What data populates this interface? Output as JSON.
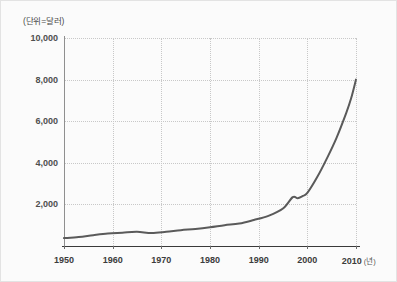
{
  "chart_data": {
    "type": "line",
    "title": "",
    "subtitle": "",
    "unit_label": "(단위=달러)",
    "xlabel": "(년)",
    "ylabel": "",
    "xlim": [
      1950,
      2010
    ],
    "ylim": [
      0,
      10000
    ],
    "grid": true,
    "legend": null,
    "y_ticks": [
      "10,000",
      "8,000",
      "6,000",
      "4,000",
      "2,000"
    ],
    "y_tick_values": [
      10000,
      8000,
      6000,
      4000,
      2000
    ],
    "x_ticks": [
      "1950",
      "1960",
      "1970",
      "1980",
      "1990",
      "2000",
      "2010"
    ],
    "x_tick_values": [
      1950,
      1960,
      1970,
      1980,
      1990,
      2000,
      2010
    ],
    "x_last_label_suffix": "(년)",
    "series": [
      {
        "name": "1인당 국민소득",
        "color": "#5a5a5a",
        "x": [
          1950,
          1953,
          1956,
          1959,
          1962,
          1965,
          1968,
          1971,
          1974,
          1977,
          1980,
          1983,
          1986,
          1989,
          1992,
          1995,
          1997,
          1998,
          1999,
          2000,
          2002,
          2004,
          2006,
          2008,
          2009,
          2010
        ],
        "values": [
          380,
          430,
          520,
          600,
          640,
          680,
          620,
          680,
          760,
          820,
          900,
          1000,
          1080,
          1250,
          1450,
          1800,
          2350,
          2300,
          2400,
          2550,
          3300,
          4200,
          5200,
          6400,
          7100,
          8000
        ]
      }
    ]
  },
  "colors": {
    "line": "#5a5a5a",
    "grid": "#c8c8c8",
    "axis": "#3a3a3a",
    "background": "#fbfbfb",
    "border": "#e3e3e3",
    "text": "#3c3c3c"
  }
}
